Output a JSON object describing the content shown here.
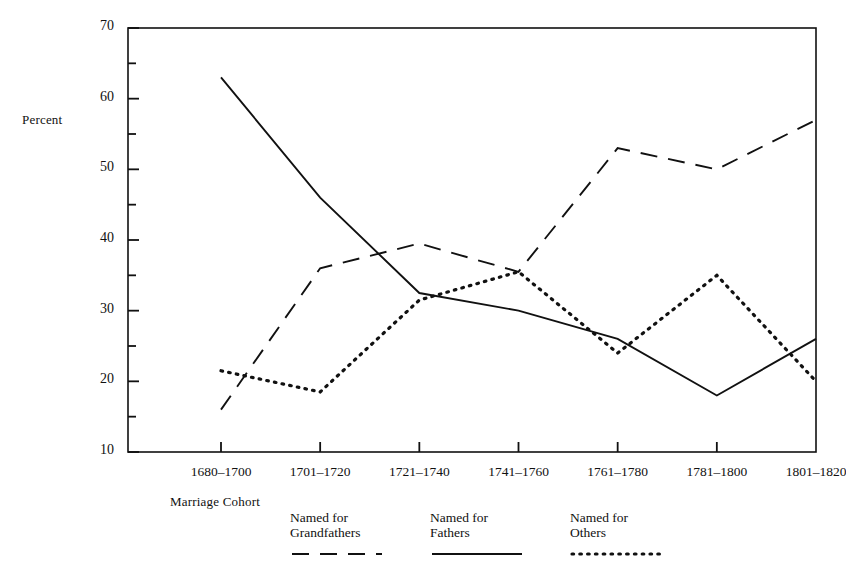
{
  "axes": {
    "ylabel": "Percent",
    "xlabel": "Marriage Cohort",
    "ytick_labels": [
      "70",
      "60",
      "50",
      "40",
      "30",
      "20",
      "10"
    ],
    "xtick_labels": [
      "1680–1700",
      "1701–1720",
      "1721–1740",
      "1741–1760",
      "1761–1780",
      "1781–1800",
      "1801–1820"
    ]
  },
  "legend": [
    {
      "line1": "Named for",
      "line2": "Grandfathers",
      "style": "dashed"
    },
    {
      "line1": "Named for",
      "line2": "Fathers",
      "style": "solid"
    },
    {
      "line1": "Named for",
      "line2": "Others",
      "style": "dotted"
    }
  ],
  "colors": {
    "ink": "#111111",
    "background": "#ffffff"
  },
  "chart_data": {
    "type": "line",
    "title": "",
    "xlabel": "Marriage Cohort",
    "ylabel": "Percent",
    "categories": [
      "1680–1700",
      "1701–1720",
      "1721–1740",
      "1741–1760",
      "1761–1780",
      "1781–1800",
      "1801–1820"
    ],
    "ylim": [
      10,
      70
    ],
    "ytick_major": [
      10,
      20,
      30,
      40,
      50,
      60,
      70
    ],
    "ytick_minor": [
      15,
      25,
      35,
      45,
      55,
      65
    ],
    "grid": false,
    "legend_position": "below-axes",
    "series": [
      {
        "name": "Named for Grandfathers",
        "style": "dashed",
        "values": [
          16,
          36,
          39.5,
          35.5,
          53,
          50,
          57
        ]
      },
      {
        "name": "Named for Fathers",
        "style": "solid",
        "values": [
          63,
          46,
          32.5,
          30,
          26,
          18,
          26
        ]
      },
      {
        "name": "Named for Others",
        "style": "dotted",
        "values": [
          21.5,
          18.5,
          31.5,
          35.5,
          24,
          35,
          20
        ]
      }
    ]
  }
}
